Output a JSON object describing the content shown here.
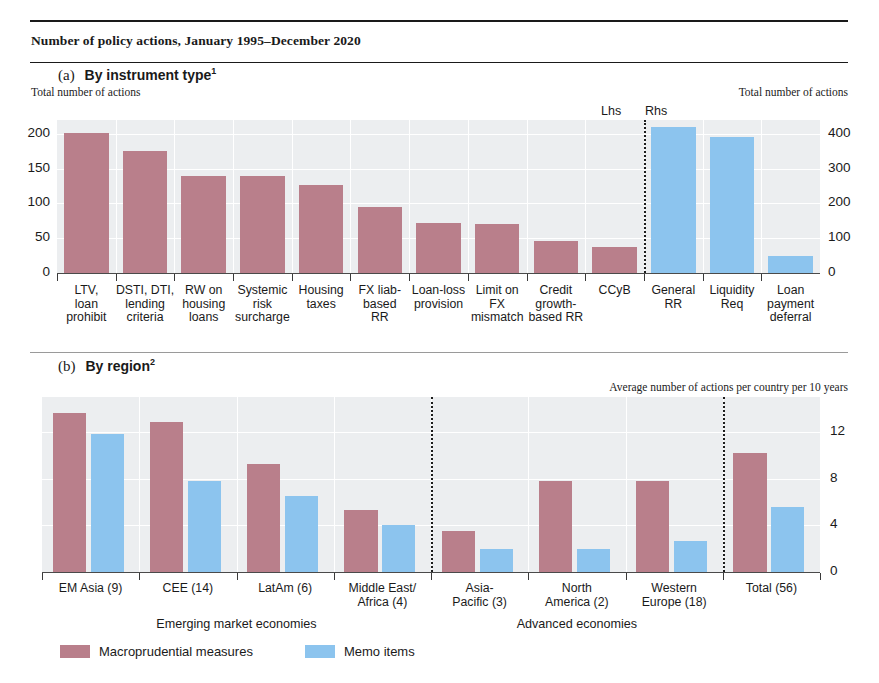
{
  "figure": {
    "title": "Number of policy actions, January 1995–December 2020",
    "legend": [
      {
        "label": "Macroprudential measures",
        "color": "#b97f8b",
        "key": "macro"
      },
      {
        "label": "Memo items",
        "color": "#8cc4ee",
        "key": "memo"
      }
    ]
  },
  "panel_a": {
    "letter": "(a)",
    "title": "By instrument type",
    "footnote_marker": "1",
    "left_caption": "Total number of actions",
    "right_caption": "Total number of actions",
    "lhs_label": "Lhs",
    "rhs_label": "Rhs",
    "y_left_ticks": [
      "200",
      "150",
      "100",
      "50",
      "0"
    ],
    "y_right_ticks": [
      "400",
      "300",
      "200",
      "100",
      "0"
    ]
  },
  "panel_b": {
    "letter": "(b)",
    "title": "By region",
    "footnote_marker": "2",
    "right_caption": "Average number of actions per country per 10 years",
    "y_right_ticks": [
      "12",
      "8",
      "4",
      "0"
    ],
    "group_labels": [
      "Emerging market economies",
      "Advanced economies"
    ]
  },
  "chart_data": [
    {
      "type": "bar",
      "title": "(a) By instrument type",
      "subtitle": "Number of policy actions, January 1995–December 2020",
      "xlabel": "",
      "ylabel": "Total number of actions",
      "ylim": [
        0,
        220
      ],
      "y_right_label": "Total number of actions",
      "ylim_right": [
        0,
        440
      ],
      "yticks": [
        0,
        50,
        100,
        150,
        200
      ],
      "yticks_right": [
        0,
        100,
        200,
        300,
        400
      ],
      "grid": true,
      "legend_position": "bottom",
      "axis_split_note": "Left 10 categories on Lhs scale; right 3 categories on Rhs scale",
      "categories": [
        "LTV, loan prohibit",
        "DSTI, DTI, lending criteria",
        "RW on housing loans",
        "Systemic risk surcharge",
        "Housing taxes",
        "FX liab-based RR",
        "Loan-loss provision",
        "Limit on FX mismatch",
        "Credit growth-based RR",
        "CCyB",
        "General RR",
        "Liquidity Req",
        "Loan payment deferral"
      ],
      "category_lines": [
        [
          "LTV,",
          "loan",
          "prohibit"
        ],
        [
          "DSTI, DTI,",
          "lending",
          "criteria"
        ],
        [
          "RW on",
          "housing",
          "loans"
        ],
        [
          "Systemic",
          "risk",
          "surcharge"
        ],
        [
          "Housing",
          "taxes"
        ],
        [
          "FX liab-",
          "based",
          "RR"
        ],
        [
          "Loan-loss",
          "provision"
        ],
        [
          "Limit on",
          "FX",
          "mismatch"
        ],
        [
          "Credit",
          "growth-",
          "based RR"
        ],
        [
          "CCyB"
        ],
        [
          "General",
          "RR"
        ],
        [
          "Liquidity",
          "Req"
        ],
        [
          "Loan",
          "payment",
          "deferral"
        ]
      ],
      "values": [
        201,
        176,
        140,
        140,
        126,
        95,
        72,
        71,
        46,
        37,
        420,
        390,
        50
      ],
      "axis_of_value": [
        "lhs",
        "lhs",
        "lhs",
        "lhs",
        "lhs",
        "lhs",
        "lhs",
        "lhs",
        "lhs",
        "lhs",
        "rhs",
        "rhs",
        "rhs"
      ],
      "series_key": [
        "macro",
        "macro",
        "macro",
        "macro",
        "macro",
        "macro",
        "macro",
        "macro",
        "macro",
        "macro",
        "memo",
        "memo",
        "memo"
      ]
    },
    {
      "type": "bar",
      "title": "(b) By region",
      "xlabel": "",
      "ylabel": "Average number of actions per country per 10 years",
      "ylim": [
        0,
        15
      ],
      "yticks": [
        0,
        4,
        8,
        12
      ],
      "grid": true,
      "legend_position": "bottom",
      "categories": [
        "EM Asia (9)",
        "CEE (14)",
        "LatAm (6)",
        "Middle East/Africa (4)",
        "Asia-Pacific (3)",
        "North America (2)",
        "Western Europe (18)",
        "Total (56)"
      ],
      "category_lines": [
        [
          "EM Asia (9)"
        ],
        [
          "CEE (14)"
        ],
        [
          "LatAm (6)"
        ],
        [
          "Middle East/",
          "Africa (4)"
        ],
        [
          "Asia-",
          "Pacific (3)"
        ],
        [
          "North",
          "America (2)"
        ],
        [
          "Western",
          "Europe (18)"
        ],
        [
          "Total (56)"
        ]
      ],
      "series": [
        {
          "name": "Macroprudential measures",
          "key": "macro",
          "values": [
            13.6,
            12.9,
            9.3,
            5.3,
            3.5,
            7.8,
            7.8,
            10.2
          ]
        },
        {
          "name": "Memo items",
          "key": "memo",
          "values": [
            11.8,
            7.8,
            6.5,
            4.0,
            2.0,
            2.0,
            2.7,
            5.6
          ]
        }
      ],
      "group_spans": [
        {
          "label": "Emerging market economies",
          "from": 0,
          "to": 3
        },
        {
          "label": "Advanced economies",
          "from": 4,
          "to": 6
        }
      ]
    }
  ]
}
